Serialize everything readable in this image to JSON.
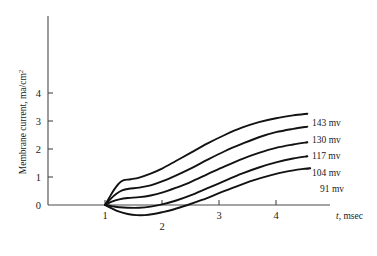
{
  "chart_data": {
    "type": "line",
    "title": "",
    "xlabel": "t, msec",
    "ylabel": "Membrane current, ma/cm2",
    "ylabel_display": "Membrane current, ma/cm",
    "ylabel_superscript": "2",
    "xlabel_italic_part": "t",
    "xlabel_rest": ", msec",
    "xlim": [
      0,
      5
    ],
    "ylim": [
      -0.45,
      5.0
    ],
    "grid": false,
    "legend": "inline-right-end-labels",
    "xticks": [
      1,
      2,
      3,
      4
    ],
    "xtick_labels": [
      "1",
      "2",
      "3",
      "4"
    ],
    "yticks": [
      0,
      1,
      2,
      3,
      4
    ],
    "ytick_labels": [
      "0",
      "1",
      "2",
      "3",
      "4"
    ],
    "origin_label": "0",
    "series": [
      {
        "name": "143 mv",
        "label": "143 mv",
        "x": [
          1.0,
          1.08,
          1.16,
          1.24,
          1.32,
          1.45,
          1.6,
          1.8,
          2.0,
          2.25,
          2.5,
          2.8,
          3.1,
          3.4,
          3.7,
          4.0,
          4.3,
          4.55
        ],
        "values": [
          0.0,
          0.28,
          0.55,
          0.76,
          0.88,
          0.92,
          0.98,
          1.12,
          1.3,
          1.58,
          1.86,
          2.2,
          2.5,
          2.76,
          2.96,
          3.1,
          3.2,
          3.26
        ]
      },
      {
        "name": "130 mv",
        "label": "130 mv",
        "x": [
          1.0,
          1.1,
          1.2,
          1.3,
          1.42,
          1.6,
          1.8,
          2.0,
          2.25,
          2.5,
          2.8,
          3.1,
          3.4,
          3.7,
          4.0,
          4.3,
          4.55
        ],
        "values": [
          0.0,
          0.22,
          0.4,
          0.52,
          0.58,
          0.62,
          0.7,
          0.84,
          1.06,
          1.3,
          1.62,
          1.92,
          2.18,
          2.42,
          2.6,
          2.72,
          2.8
        ]
      },
      {
        "name": "117 mv",
        "label": "117 mv",
        "x": [
          1.0,
          1.12,
          1.25,
          1.4,
          1.6,
          1.8,
          2.0,
          2.25,
          2.5,
          2.8,
          3.1,
          3.4,
          3.7,
          4.0,
          4.3,
          4.55
        ],
        "values": [
          0.0,
          0.12,
          0.2,
          0.25,
          0.28,
          0.34,
          0.44,
          0.62,
          0.82,
          1.1,
          1.38,
          1.64,
          1.86,
          2.04,
          2.16,
          2.24
        ]
      },
      {
        "name": "104 mv",
        "label": "104 mv",
        "x": [
          1.0,
          1.12,
          1.25,
          1.4,
          1.6,
          1.8,
          2.0,
          2.25,
          2.5,
          2.8,
          3.1,
          3.4,
          3.7,
          4.0,
          4.3,
          4.55
        ],
        "values": [
          0.0,
          -0.04,
          -0.08,
          -0.1,
          -0.1,
          -0.06,
          0.02,
          0.16,
          0.34,
          0.6,
          0.86,
          1.12,
          1.34,
          1.52,
          1.66,
          1.74
        ]
      },
      {
        "name": "91 mv",
        "label": "91 mv",
        "x": [
          1.0,
          1.12,
          1.25,
          1.4,
          1.55,
          1.7,
          1.85,
          2.0,
          2.2,
          2.45,
          2.7,
          3.0,
          3.3,
          3.6,
          3.9,
          4.2,
          4.45,
          4.6
        ],
        "values": [
          0.0,
          -0.12,
          -0.24,
          -0.32,
          -0.36,
          -0.36,
          -0.32,
          -0.26,
          -0.16,
          0.0,
          0.18,
          0.42,
          0.66,
          0.88,
          1.06,
          1.2,
          1.28,
          1.31
        ]
      }
    ]
  },
  "style": {
    "curve_color": "#121212",
    "axis_color": "#4a4a4a",
    "text_color": "#1a1a1a",
    "background": "#ffffff"
  }
}
